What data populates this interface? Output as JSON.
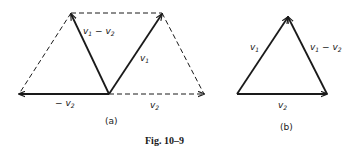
{
  "figure": {
    "caption": "Fig. 10–9",
    "panel_a": {
      "label": "(a)",
      "vectors": [
        {
          "name": "v1",
          "text": "v",
          "sub": "1"
        },
        {
          "name": "v2",
          "text": "v",
          "sub": "2"
        },
        {
          "name": "neg-v2",
          "text": "− v",
          "sub": "2"
        },
        {
          "name": "v1-minus-v2",
          "text": "v",
          "sub": "1",
          "text2": " − v",
          "sub2": "2"
        }
      ]
    },
    "panel_b": {
      "label": "(b)",
      "vectors": [
        {
          "name": "v1",
          "text": "v",
          "sub": "1"
        },
        {
          "name": "v2",
          "text": "v",
          "sub": "2"
        },
        {
          "name": "v1-minus-v2",
          "text": "v",
          "sub": "1",
          "text2": " − v",
          "sub2": "2"
        }
      ]
    },
    "colors": {
      "ink": "#1a1a1a",
      "background": "#ffffff"
    }
  }
}
